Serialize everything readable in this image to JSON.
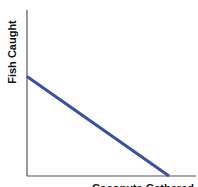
{
  "chart_data": {
    "type": "line",
    "title": "",
    "xlabel": "Coconuts Gathered",
    "ylabel": "Fish Caught",
    "xlim": [
      0,
      1
    ],
    "ylim": [
      0,
      1
    ],
    "grid": false,
    "legend": "none",
    "series": [
      {
        "name": "Production Possibilities Frontier",
        "color": "#3a4fa8",
        "points": [
          [
            0,
            0.6
          ],
          [
            0.84,
            0
          ]
        ]
      }
    ],
    "axis_color": "#555555"
  }
}
